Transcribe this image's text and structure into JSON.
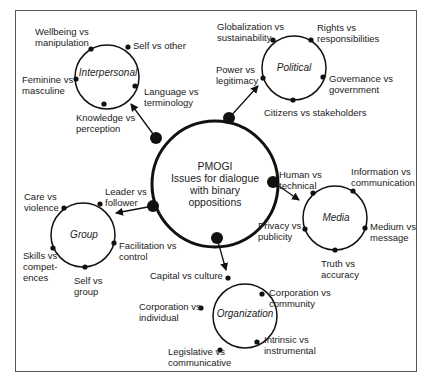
{
  "center": {
    "title": "PMOGI",
    "line1": "Issues for dialogue",
    "line2": "with binary",
    "line3": "oppositions"
  },
  "clusters": {
    "interpersonal": {
      "name": "Interpersonal",
      "items": [
        "Wellbeing vs\nmanipulation",
        "Self vs other",
        "Feminine vs\nmasculine",
        "Language vs\nterminology",
        "Knowledge vs\nperception"
      ]
    },
    "political": {
      "name": "Political",
      "items": [
        "Globalization vs\nsustainability",
        "Rights vs\nresponsibilities",
        "Power vs\nlegitimacy",
        "Governance vs\ngovernment",
        "Citizens vs stakeholders"
      ]
    },
    "group": {
      "name": "Group",
      "items": [
        "Care vs\nviolence",
        "Leader vs\nfollower",
        "Facilitation vs\ncontrol",
        "Skills vs\ncompet-\nences",
        "Self vs\ngroup"
      ]
    },
    "media": {
      "name": "Media",
      "items": [
        "Human vs\ntechnical",
        "Information vs\ncommunication",
        "Privacy vs\npublicity",
        "Medium vs\nmessage",
        "Truth vs\naccuracy"
      ]
    },
    "organization": {
      "name": "Organization",
      "items": [
        "Capital vs culture",
        "Corporation vs\ncommunity",
        "Corporation vs\nindividual",
        "Intrinsic vs\ninstrumental",
        "Legislative vs\ncommunicative"
      ]
    }
  },
  "colors": {
    "stroke": "#111111",
    "text": "#222222",
    "frame": "#555555"
  }
}
